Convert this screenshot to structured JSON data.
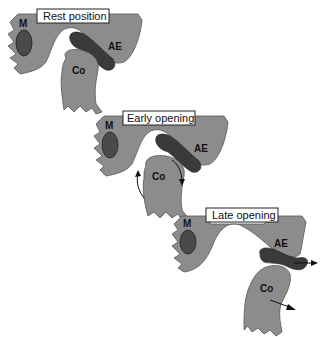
{
  "figure": {
    "panels": [
      {
        "id": "rest",
        "title": "Rest position",
        "labels": {
          "muscle": "M",
          "eminence": "AE",
          "condyle": "Co"
        }
      },
      {
        "id": "early",
        "title": "Early opening",
        "labels": {
          "muscle": "M",
          "eminence": "AE",
          "condyle": "Co"
        }
      },
      {
        "id": "late",
        "title": "Late opening",
        "labels": {
          "muscle": "M",
          "eminence": "AE",
          "condyle": "Co"
        }
      }
    ],
    "colors": {
      "bone": "#8c8c8c",
      "disc": "#3a3a3a",
      "muscle": "#4a4a4a",
      "background": "#ffffff"
    }
  }
}
